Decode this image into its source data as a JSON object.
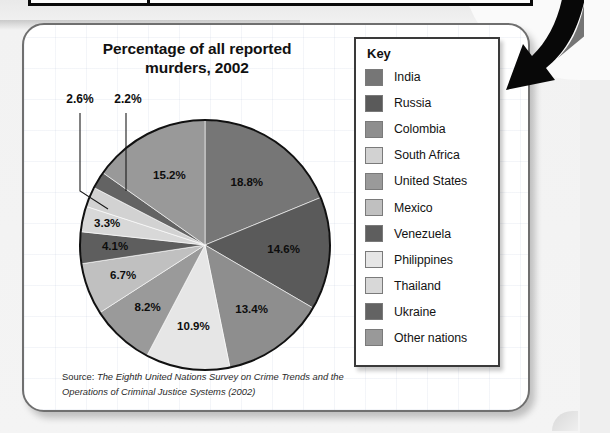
{
  "card": {
    "title": "Percentage of all reported murders, 2002",
    "title_line1": "Percentage of all reported",
    "title_line2": "murders, 2002",
    "source_lead": "Source:",
    "source_text": " The Eighth United Nations Survey on Crime Trends and the Operations of Criminal Justice Systems (2002)"
  },
  "legend": {
    "title": "Key",
    "items": [
      {
        "label": "India",
        "color": "#767676"
      },
      {
        "label": "Russia",
        "color": "#5a5a5a"
      },
      {
        "label": "Colombia",
        "color": "#8e8e8e"
      },
      {
        "label": "South Africa",
        "color": "#d2d2d2"
      },
      {
        "label": "United States",
        "color": "#9a9a9a"
      },
      {
        "label": "Mexico",
        "color": "#c0c0c0"
      },
      {
        "label": "Venezuela",
        "color": "#5e5e5e"
      },
      {
        "label": "Philippines",
        "color": "#e6e6e6"
      },
      {
        "label": "Thailand",
        "color": "#d8d8d8"
      },
      {
        "label": "Ukraine",
        "color": "#636363"
      },
      {
        "label": "Other nations",
        "color": "#999999"
      }
    ]
  },
  "chart_data": {
    "type": "pie",
    "title": "Percentage of all reported murders, 2002",
    "units": "%",
    "start_angle_deg": 0,
    "direction": "clockwise",
    "legend_position": "right",
    "grid": false,
    "source": "The Eighth United Nations Survey on Crime Trends and the Operations of Criminal Justice Systems (2002)",
    "categories": [
      "India",
      "Russia",
      "Colombia",
      "Philippines",
      "United States",
      "Mexico",
      "Venezuela",
      "Thailand",
      "South Africa",
      "Ukraine",
      "Other nations"
    ],
    "values": [
      18.8,
      14.6,
      13.4,
      10.9,
      8.2,
      6.7,
      4.1,
      3.3,
      2.6,
      2.2,
      15.2
    ],
    "slices": [
      {
        "label": "India",
        "value": 18.8,
        "display": "18.8%",
        "color": "#767676",
        "callout": false
      },
      {
        "label": "Russia",
        "value": 14.6,
        "display": "14.6%",
        "color": "#5a5a5a",
        "callout": false
      },
      {
        "label": "Colombia",
        "value": 13.4,
        "display": "13.4%",
        "color": "#8e8e8e",
        "callout": false
      },
      {
        "label": "Philippines",
        "value": 10.9,
        "display": "10.9%",
        "color": "#e6e6e6",
        "callout": false
      },
      {
        "label": "United States",
        "value": 8.2,
        "display": "8.2%",
        "color": "#9a9a9a",
        "callout": false
      },
      {
        "label": "Mexico",
        "value": 6.7,
        "display": "6.7%",
        "color": "#c0c0c0",
        "callout": false
      },
      {
        "label": "Venezuela",
        "value": 4.1,
        "display": "4.1%",
        "color": "#5e5e5e",
        "callout": false
      },
      {
        "label": "Thailand",
        "value": 3.3,
        "display": "3.3%",
        "color": "#d8d8d8",
        "callout": false
      },
      {
        "label": "South Africa",
        "value": 2.6,
        "display": "2.6%",
        "color": "#d2d2d2",
        "callout": true
      },
      {
        "label": "Ukraine",
        "value": 2.2,
        "display": "2.2%",
        "color": "#636363",
        "callout": true
      },
      {
        "label": "Other nations",
        "value": 15.2,
        "display": "15.2%",
        "color": "#999999",
        "callout": false
      }
    ]
  },
  "annotation": {
    "arrow_name": "curved-down-left-arrow"
  }
}
